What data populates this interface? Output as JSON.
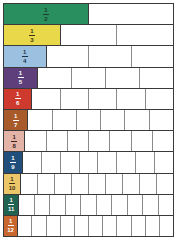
{
  "rows": [
    {
      "label_num": "1",
      "label_den": "2",
      "denominator": 2,
      "color": "#2a8f5f",
      "text_color": "#1d3a2a"
    },
    {
      "label_num": "1",
      "label_den": "3",
      "denominator": 3,
      "color": "#e8d84a",
      "text_color": "#3a3410"
    },
    {
      "label_num": "1",
      "label_den": "4",
      "denominator": 4,
      "color": "#9cc1e0",
      "text_color": "#1f3447"
    },
    {
      "label_num": "1",
      "label_den": "5",
      "denominator": 5,
      "color": "#5e3f7c",
      "text_color": "#ffffff"
    },
    {
      "label_num": "1",
      "label_den": "6",
      "denominator": 6,
      "color": "#cf3a2e",
      "text_color": "#ffffff"
    },
    {
      "label_num": "1",
      "label_den": "7",
      "denominator": 7,
      "color": "#a85a2a",
      "text_color": "#ffffff"
    },
    {
      "label_num": "1",
      "label_den": "8",
      "denominator": 8,
      "color": "#e3b3a8",
      "text_color": "#3a2420"
    },
    {
      "label_num": "1",
      "label_den": "9",
      "denominator": 9,
      "color": "#1f4f7a",
      "text_color": "#ffffff"
    },
    {
      "label_num": "1",
      "label_den": "10",
      "denominator": 10,
      "color": "#ecc76a",
      "text_color": "#3a2e10"
    },
    {
      "label_num": "1",
      "label_den": "11",
      "denominator": 11,
      "color": "#1f6350",
      "text_color": "#ffffff"
    },
    {
      "label_num": "1",
      "label_den": "12",
      "denominator": 12,
      "color": "#c9662e",
      "text_color": "#ffffff"
    }
  ]
}
